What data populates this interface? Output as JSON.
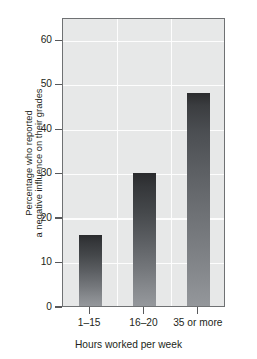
{
  "chart_data": {
    "type": "bar",
    "title": "",
    "subtitle": "",
    "xlabel": "Hours worked per week",
    "ylabel": "Percentage who reported a negative influence on their grades",
    "ylabel_lines": [
      "Percentage who reported",
      "a negative influence on their grades"
    ],
    "categories": [
      "1–15",
      "16–20",
      "35 or more"
    ],
    "values": [
      16,
      30,
      48
    ],
    "ylim": [
      0,
      65
    ],
    "yticks": [
      0,
      10,
      20,
      30,
      40,
      50,
      60
    ],
    "ytick_labels": [
      "0",
      "10",
      "20",
      "30",
      "40",
      "50",
      "60"
    ],
    "grid": "horizontal-and-vertical",
    "legend": "none",
    "annotations": [],
    "colors": {
      "plot_background": "#e7e8e8",
      "gridline": "#fdfdfd",
      "axis_frame": "#6f7173",
      "bar_top": "#2a2b2d",
      "bar_bottom": "#95989c",
      "text": "#231f20",
      "tick_mark": "#58595b",
      "page_background": "#ffffff"
    }
  },
  "axes": {
    "y_title_line1": "Percentage who reported",
    "y_title_line2": "a negative influence on their grades",
    "x_title": "Hours worked per week"
  }
}
